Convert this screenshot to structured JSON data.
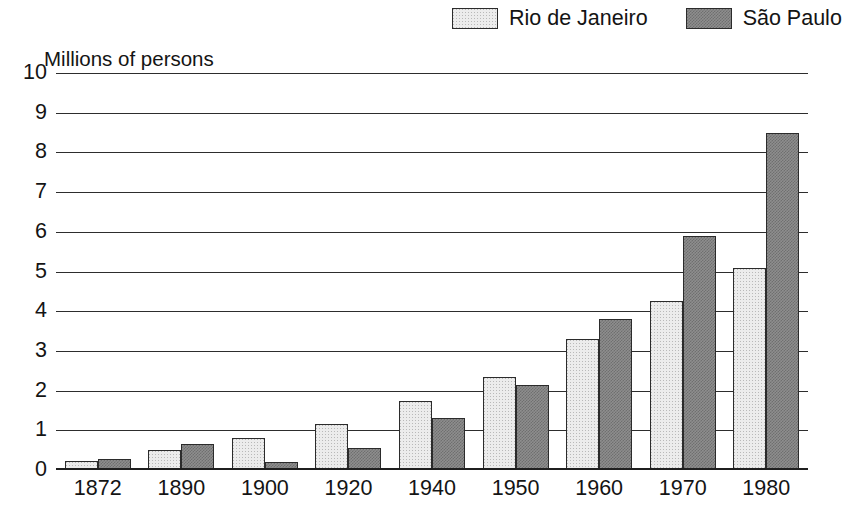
{
  "legend": {
    "entries": [
      {
        "label": "Rio de Janeiro",
        "swatch": "light-stipple",
        "color": "#ececec"
      },
      {
        "label": "São Paulo",
        "swatch": "dark-checker",
        "color": "#8e8e8e"
      }
    ]
  },
  "axis": {
    "y_title": "Millions of persons",
    "y_ticks": [
      "10",
      "9",
      "8",
      "7",
      "6",
      "5",
      "4",
      "3",
      "2",
      "1",
      "0"
    ]
  },
  "chart_data": {
    "type": "bar",
    "title": "",
    "subtitle": "",
    "xlabel": "",
    "ylabel": "Millions of persons",
    "ylim": [
      0,
      10
    ],
    "ytick_step": 1,
    "grid": true,
    "legend_position": "top-right",
    "categories": [
      "1872",
      "1890",
      "1900",
      "1920",
      "1940",
      "1950",
      "1960",
      "1970",
      "1980"
    ],
    "series": [
      {
        "name": "Rio de Janeiro",
        "color": "#ececec",
        "values": [
          0.22,
          0.5,
          0.8,
          1.15,
          1.75,
          2.35,
          3.3,
          4.25,
          5.1
        ]
      },
      {
        "name": "São Paulo",
        "color": "#8e8e8e",
        "values": [
          0.27,
          0.65,
          0.2,
          0.55,
          1.3,
          2.15,
          3.8,
          5.9,
          8.5
        ]
      }
    ]
  }
}
